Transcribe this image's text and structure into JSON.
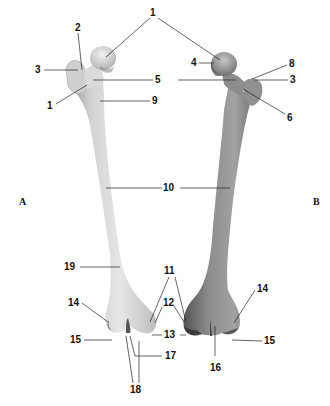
{
  "figure": {
    "panels": [
      {
        "id": "A",
        "label": "A",
        "view": "left femur"
      },
      {
        "id": "B",
        "label": "B",
        "view": "right femur"
      }
    ],
    "labels": {
      "l1_top": "1",
      "l2": "2",
      "l3_left": "3",
      "l1_left": "1",
      "l5": "5",
      "l9": "9",
      "l4": "4",
      "l8": "8",
      "l3_right": "3",
      "l6": "6",
      "l10": "10",
      "l19": "19",
      "l11": "11",
      "l12": "12",
      "l13": "13",
      "l14_left": "14",
      "l14_right": "14",
      "l15_left": "15",
      "l15_right": "15",
      "l16": "16",
      "l17": "17",
      "l18": "18"
    },
    "colors": {
      "bone_left_light": "#e4e4e4",
      "bone_left_mid": "#c8c8c8",
      "bone_left_dark": "#8a8a8a",
      "bone_right_light": "#a0a0a0",
      "bone_right_mid": "#7a7a7a",
      "bone_right_dark": "#3a3a3a",
      "line": "#222222",
      "background": "#ffffff"
    }
  }
}
